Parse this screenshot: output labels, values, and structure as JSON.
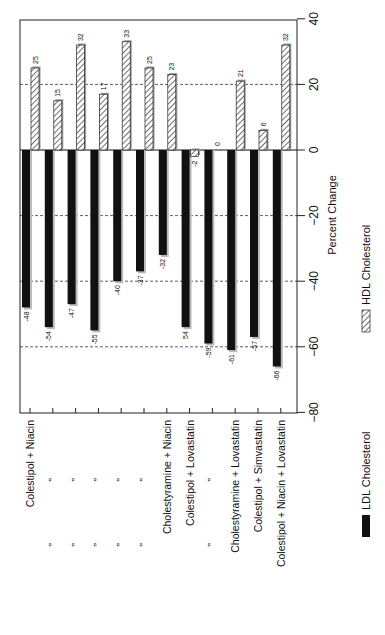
{
  "chart_data": {
    "type": "bar",
    "orientation": "rotated-90-clockwise",
    "title": "",
    "xlabel": "",
    "ylabel": "Percent Change",
    "ylim": [
      -80,
      40
    ],
    "yticks": [
      40,
      20,
      0,
      -20,
      -40,
      -60,
      -80
    ],
    "grid": "dashed lines at 20, -20, -40, -60",
    "legend_position": "bottom-right (rotated)",
    "categories": [
      "Colestipol + Niacin",
      "”",
      "”",
      "”",
      "”",
      "”",
      "Cholestyramine + Niacin",
      "Colestipol + Lovastatin",
      "”",
      "Cholestyramine + Lovastatin",
      "Colestipol + Simvastatin",
      "Colestipol + Niacin + Lovastatin"
    ],
    "series": [
      {
        "name": "LDL Cholesterol",
        "style": "solid-black",
        "color": "#111111",
        "values": [
          -48,
          -54,
          -47,
          -55,
          -40,
          -37,
          -32,
          -54,
          -59,
          -61,
          -57,
          -66
        ],
        "labels": [
          "-48",
          "-54",
          "-47",
          "-55",
          "-40",
          "-37",
          "-32",
          "54",
          "-59",
          "-61",
          "-57",
          "-66"
        ]
      },
      {
        "name": "HDL Cholesterol",
        "style": "diagonal-hatch",
        "color": "#ffffff",
        "values": [
          25,
          15,
          32,
          17,
          33,
          25,
          23,
          -2,
          0,
          21,
          6,
          32
        ],
        "labels": [
          "25",
          "15",
          "32",
          "17",
          "33",
          "25",
          "23",
          "-2",
          "0",
          "21",
          "6",
          "32"
        ]
      }
    ]
  },
  "axis": {
    "title": "Percent Change",
    "ticks": [
      "40",
      "20",
      "0",
      "-20",
      "-40",
      "-60",
      "-80"
    ]
  },
  "legend": {
    "ldl": "LDL Cholesterol",
    "hdl": "HDL Cholesterol"
  }
}
